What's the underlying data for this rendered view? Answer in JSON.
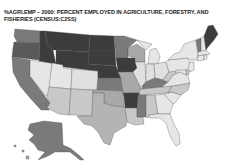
{
  "title": "%AGRI.EMP – 2000: PERCENT EMPLOYED IN AGRICULTURE, FORESTRY, AND FISHERIES (CENSUS:C2SS)",
  "map": {
    "type": "choropleth",
    "region": "United States",
    "variable": "Percent employed in agriculture, forestry, and fisheries",
    "year": "2000",
    "source": "CENSUS:C2SS",
    "shade_scale": [
      "#e6e6e6",
      "#c8c8c8",
      "#a8a8a8",
      "#7a7a7a",
      "#3c3c3c"
    ],
    "states": {
      "WA": 3,
      "OR": 3,
      "CA": 3,
      "NV": 0,
      "ID": 4,
      "MT": 4,
      "WY": 4,
      "UT": 0,
      "AZ": 1,
      "CO": 1,
      "NM": 1,
      "ND": 4,
      "SD": 4,
      "NE": 4,
      "KS": 3,
      "OK": 2,
      "TX": 1,
      "MN": 3,
      "IA": 4,
      "MO": 2,
      "AR": 4,
      "LA": 1,
      "WI": 2,
      "IL": 0,
      "MI": 0,
      "IN": 0,
      "OH": 0,
      "KY": 3,
      "TN": 1,
      "MS": 3,
      "AL": 1,
      "GA": 0,
      "FL": 0,
      "SC": 0,
      "NC": 1,
      "VA": 0,
      "WV": 1,
      "PA": 0,
      "NY": 0,
      "VT": 3,
      "NH": 0,
      "ME": 4,
      "MA": 0,
      "CT": 0,
      "RI": 0,
      "NJ": 0,
      "DE": 1,
      "MD": 0,
      "AK": 3,
      "HI": 1
    }
  }
}
